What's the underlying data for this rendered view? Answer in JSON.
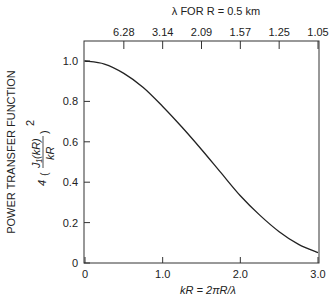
{
  "chart_data": {
    "type": "line",
    "title": "",
    "top_axis_title": "λ FOR R = 0.5 km",
    "top_tick_labels": [
      "6.28",
      "3.14",
      "2.09",
      "1.57",
      "1.25",
      "1.05"
    ],
    "top_tick_positions_kR": [
      0.5,
      1.0,
      1.5,
      2.0,
      2.5,
      3.0
    ],
    "xlabel": "kR = 2πR/λ",
    "ylabel": "POWER TRANSFER FUNCTION",
    "ylabel_formula": "4(J1(kR)/kR)^2",
    "x_tick_labels": [
      "0",
      "1.0",
      "2.0",
      "3.0"
    ],
    "x_ticks": [
      0,
      1.0,
      2.0,
      3.0
    ],
    "y_tick_labels": [
      "0",
      "0.2",
      "0.4",
      "0.6",
      "0.8",
      "1.0"
    ],
    "y_ticks": [
      0,
      0.2,
      0.4,
      0.6,
      0.8,
      1.0
    ],
    "xlim": [
      0,
      3.0
    ],
    "ylim": [
      0,
      1.1
    ],
    "grid": false,
    "series": [
      {
        "name": "4(J1(kR)/kR)^2",
        "x": [
          0,
          0.25,
          0.5,
          0.75,
          1.0,
          1.25,
          1.5,
          1.75,
          2.0,
          2.25,
          2.5,
          2.75,
          3.0
        ],
        "values": [
          1.0,
          0.985,
          0.939,
          0.869,
          0.775,
          0.672,
          0.562,
          0.447,
          0.333,
          0.237,
          0.155,
          0.092,
          0.051
        ]
      }
    ]
  }
}
